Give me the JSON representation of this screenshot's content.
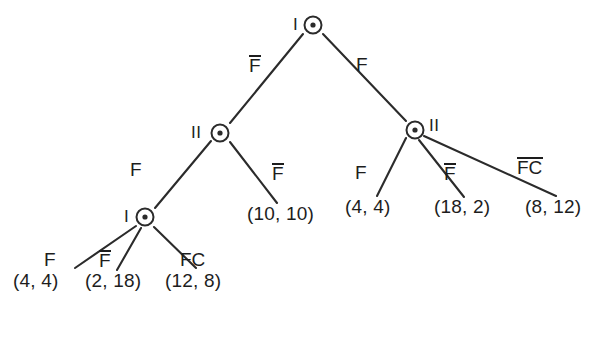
{
  "diagram": {
    "line_color": "#2b2b2b",
    "text_color": "#1d1d1d",
    "background_color": "#ffffff"
  },
  "nodes": {
    "root": {
      "player": "I",
      "x": 313,
      "y": 25
    },
    "left_two": {
      "player": "II",
      "x": 220,
      "y": 133
    },
    "right_two": {
      "player": "II",
      "x": 415,
      "y": 130
    },
    "left_one": {
      "player": "I",
      "x": 145,
      "y": 217
    }
  },
  "actions": {
    "root_left": "F",
    "root_left_overbar": true,
    "root_right": "F",
    "root_right_overbar": false,
    "left_two_left": "F",
    "left_two_left_overbar": false,
    "left_two_right": "F",
    "left_two_right_overbar": true,
    "left_one_a": "F",
    "left_one_a_overbar": false,
    "left_one_b": "F",
    "left_one_b_overbar": true,
    "left_one_c": "FC",
    "left_one_c_overbar": false,
    "right_two_a": "F",
    "right_two_a_overbar": false,
    "right_two_b": "F",
    "right_two_b_overbar": true,
    "right_two_c": "FC",
    "right_two_c_overbar": true
  },
  "payoffs": {
    "left_two_right": "(10, 10)",
    "left_one_a": "(4, 4)",
    "left_one_b": "(2, 18)",
    "left_one_c": "(12, 8)",
    "right_two_a": "(4, 4)",
    "right_two_b": "(18, 2)",
    "right_two_c": "(8, 12)"
  }
}
